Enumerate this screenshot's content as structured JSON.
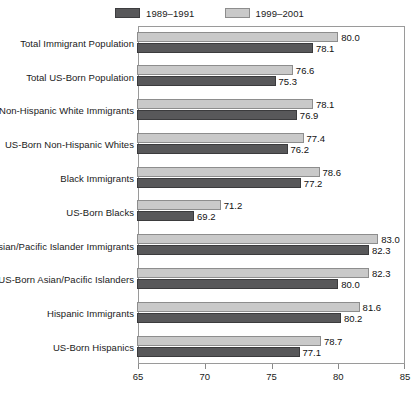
{
  "chart_data": {
    "type": "bar",
    "orientation": "horizontal",
    "title": "",
    "subtitle": "",
    "xlabel": "",
    "ylabel": "",
    "xlim": [
      65,
      85
    ],
    "xticks": [
      65,
      70,
      75,
      80,
      85
    ],
    "grid": false,
    "legend_position": "top-center",
    "categories": [
      "Total Immigrant Population",
      "Total US-Born Population",
      "Non-Hispanic White Immigrants",
      "US-Born Non-Hispanic Whites",
      "Black Immigrants",
      "US-Born Blacks",
      "Asian/Pacific Islander Immigrants",
      "US-Born Asian/Pacific Islanders",
      "Hispanic Immigrants",
      "US-Born Hispanics"
    ],
    "series": [
      {
        "name": "1999–2001",
        "color": "#c9c9c9",
        "values": [
          80.0,
          76.6,
          78.1,
          77.4,
          78.6,
          71.2,
          83.0,
          82.3,
          81.6,
          78.7
        ],
        "labels": [
          "80.0",
          "76.6",
          "78.1",
          "77.4",
          "78.6",
          "71.2",
          "83.0",
          "82.3",
          "81.6",
          "78.7"
        ]
      },
      {
        "name": "1989–1991",
        "color": "#58585a",
        "values": [
          78.1,
          75.3,
          76.9,
          76.2,
          77.2,
          69.2,
          82.3,
          80.0,
          80.2,
          77.1
        ],
        "labels": [
          "78.1",
          "75.3",
          "76.9",
          "76.2",
          "77.2",
          "69.2",
          "82.3",
          "80.0",
          "80.2",
          "77.1"
        ]
      }
    ]
  },
  "legend": {
    "entries": [
      {
        "label": "1989–1991",
        "swatch": "dark-swatch-icon"
      },
      {
        "label": "1999–2001",
        "swatch": "light-swatch-icon"
      }
    ]
  },
  "axis": {
    "tick_labels": [
      "65",
      "70",
      "75",
      "80",
      "85"
    ]
  }
}
